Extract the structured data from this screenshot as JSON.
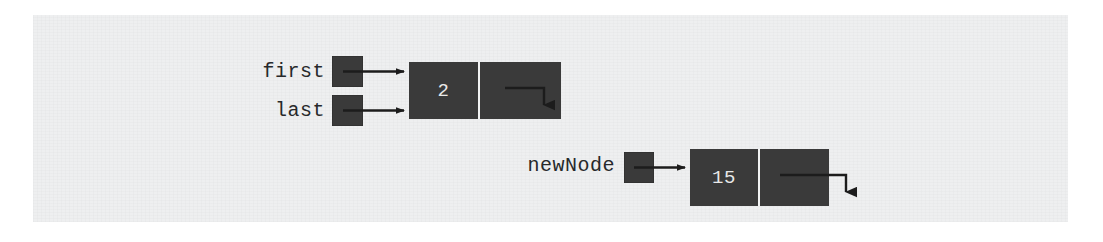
{
  "figure": {
    "background_color": "#ffffff",
    "panel_color": "#eeeff0",
    "node_color": "#3a3a3a",
    "text_color": "#27292b",
    "node_text_color": "#e8e8e8",
    "arrow_color": "#1c1c1c"
  },
  "labels": {
    "first": "first",
    "last": "last",
    "newNode": "newNode"
  },
  "nodes": [
    {
      "id": "node-existing",
      "value": "2",
      "link": "null-arrow"
    },
    {
      "id": "node-new",
      "value": "15",
      "link": "null-arrow"
    }
  ],
  "pointers": [
    {
      "name": "first",
      "target": "node-existing"
    },
    {
      "name": "last",
      "target": "node-existing"
    },
    {
      "name": "newNode",
      "target": "node-new"
    }
  ]
}
